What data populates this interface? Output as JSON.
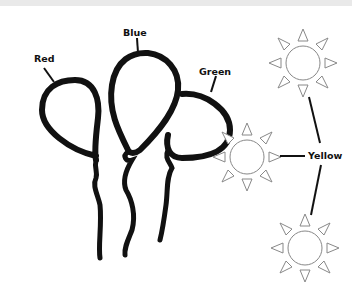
{
  "diagram": {
    "labels": {
      "red": "Red",
      "blue": "Blue",
      "green": "Green",
      "yellow": "Yellow"
    },
    "objects": [
      {
        "type": "balloon",
        "name": "Red"
      },
      {
        "type": "balloon",
        "name": "Blue"
      },
      {
        "type": "balloon",
        "name": "Green"
      },
      {
        "type": "sun",
        "name": "Yellow",
        "count": 3
      }
    ],
    "colors": {
      "stroke": "#111111",
      "sun_stroke": "#777777",
      "background": "#ffffff"
    }
  }
}
